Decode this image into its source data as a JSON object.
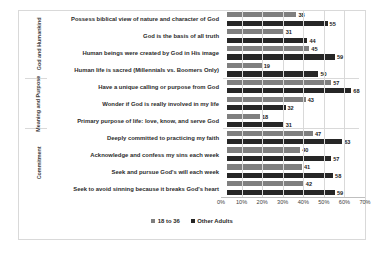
{
  "chart_data": {
    "type": "bar",
    "orientation": "horizontal",
    "title": "",
    "xlabel": "",
    "ylabel": "",
    "xlim": [
      0,
      70
    ],
    "xticks": [
      "0%",
      "10%",
      "20%",
      "30%",
      "40%",
      "50%",
      "60%",
      "70%"
    ],
    "grid": true,
    "legend_position": "bottom",
    "series": [
      {
        "name": "18 to 36",
        "color": "#7f7f7f",
        "values": [
          38,
          31,
          45,
          19,
          57,
          43,
          18,
          47,
          40,
          41,
          42
        ]
      },
      {
        "name": "Other Adults",
        "color": "#262626",
        "values": [
          55,
          44,
          59,
          50,
          68,
          32,
          31,
          63,
          57,
          58,
          59
        ]
      }
    ],
    "categories": [
      "Possess biblical view of nature and character of God",
      "God is the basis of all truth",
      "Human beings were created by God in His image",
      "Human life is sacred (Millennials vs. Boomers Only)",
      "Have a unique calling or purpose from God",
      "Wonder if God is really involved in my life",
      "Primary purpose of life: love, know, and serve God",
      "Deeply committed to practicing my faith",
      "Acknowledge and confess my sins each week",
      "Seek and pursue God's will each week",
      "Seek to avoid sinning because it breaks God's heart"
    ],
    "groups": [
      {
        "label": "God and Humankind",
        "rows": [
          {
            "category": "Possess biblical view of nature and character of God",
            "s1": 38,
            "s2": 55
          },
          {
            "category": "God is the basis of all truth",
            "s1": 31,
            "s2": 44
          },
          {
            "category": "Human beings were created by God in His image",
            "s1": 45,
            "s2": 59
          },
          {
            "category": "Human life is sacred (Millennials vs. Boomers Only)",
            "s1": 19,
            "s2": 50
          }
        ]
      },
      {
        "label": "Meaning and Purpose",
        "rows": [
          {
            "category": "Have a unique calling or purpose from God",
            "s1": 57,
            "s2": 68
          },
          {
            "category": "Wonder if God is really involved in my life",
            "s1": 43,
            "s2": 32
          },
          {
            "category": "Primary purpose of life: love, know, and serve God",
            "s1": 18,
            "s2": 31
          }
        ]
      },
      {
        "label": "Commitment",
        "rows": [
          {
            "category": "Deeply committed to practicing my faith",
            "s1": 47,
            "s2": 63
          },
          {
            "category": "Acknowledge and confess my sins each week",
            "s1": 40,
            "s2": 57
          },
          {
            "category": "Seek and pursue God's will each week",
            "s1": 41,
            "s2": 58
          },
          {
            "category": "Seek to avoid sinning because it breaks God's heart",
            "s1": 42,
            "s2": 59
          }
        ]
      }
    ]
  }
}
